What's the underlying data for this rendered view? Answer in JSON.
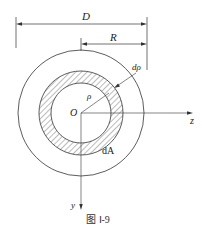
{
  "figure": {
    "caption": "图 Ⅰ-9",
    "labels": {
      "diameter": "D",
      "radius": "R",
      "differential_radius": "dρ",
      "rho": "ρ",
      "origin": "O",
      "z_axis": "z",
      "y_axis": "y",
      "area_element": "dA"
    },
    "colors": {
      "line": "#333333",
      "hatch": "#555555",
      "background": "#ffffff"
    }
  }
}
